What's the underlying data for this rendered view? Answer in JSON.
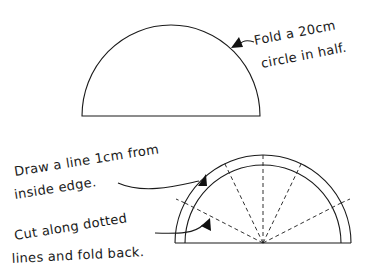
{
  "diagram": {
    "colors": {
      "ink": "#1a1a1a",
      "background": "#ffffff"
    },
    "step1": {
      "label_line1": "Fold a 20cm",
      "label_line2": "circle in half."
    },
    "step2": {
      "label_line1": "Draw a line 1cm from",
      "label_line2": "inside edge."
    },
    "step3": {
      "label_line1": "Cut along dotted",
      "label_line2": "lines and fold back."
    }
  }
}
